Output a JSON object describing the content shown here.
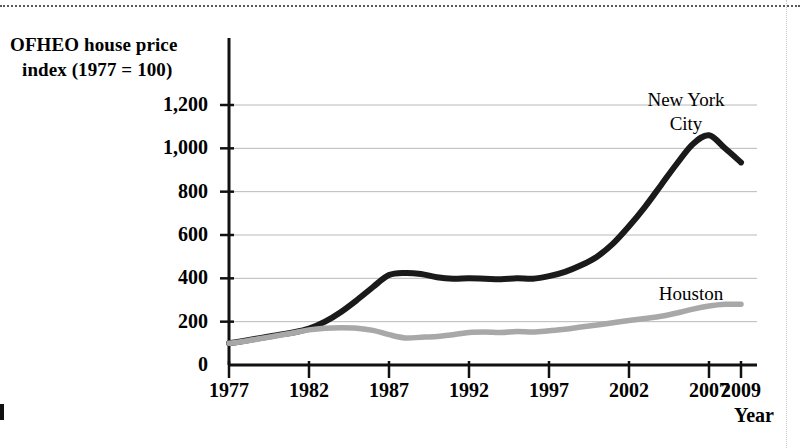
{
  "chart_data": {
    "type": "line",
    "title": "",
    "ylabel": "OFHEO house price index (1977 = 100)",
    "ylabel_line1": "OFHEO house price",
    "ylabel_line2": "index (1977 = 100)",
    "xlabel": "Year",
    "ylim": [
      0,
      1200
    ],
    "xlim": [
      1977,
      2009
    ],
    "grid": true,
    "gridlines_y": [
      200,
      400,
      600,
      800,
      1000,
      1200
    ],
    "ytick_labels": [
      "0",
      "200",
      "400",
      "600",
      "800",
      "1,000",
      "1,200"
    ],
    "ytick_values": [
      0,
      200,
      400,
      600,
      800,
      1000,
      1200
    ],
    "xtick_labels": [
      "1977",
      "1982",
      "1987",
      "1992",
      "1997",
      "2002",
      "2007",
      "2009"
    ],
    "xtick_values": [
      1977,
      1982,
      1987,
      1992,
      1997,
      2002,
      2007,
      2009
    ],
    "legend_position": "inline-labels",
    "x": [
      1977,
      1978,
      1979,
      1980,
      1981,
      1982,
      1983,
      1984,
      1985,
      1986,
      1987,
      1988,
      1989,
      1990,
      1991,
      1992,
      1993,
      1994,
      1995,
      1996,
      1997,
      1998,
      1999,
      2000,
      2001,
      2002,
      2003,
      2004,
      2005,
      2006,
      2007,
      2008,
      2009
    ],
    "series": [
      {
        "name": "New York City",
        "label_line1": "New York",
        "label_line2": "City",
        "color": "#1a1a1a",
        "values": [
          100,
          112,
          125,
          138,
          150,
          168,
          200,
          245,
          300,
          360,
          415,
          425,
          420,
          405,
          398,
          400,
          398,
          396,
          400,
          398,
          410,
          430,
          460,
          500,
          560,
          640,
          730,
          830,
          930,
          1020,
          1060,
          1000,
          935
        ]
      },
      {
        "name": "Houston",
        "label_line1": "Houston",
        "label_line2": "",
        "color": "#a8a8a8",
        "values": [
          100,
          110,
          122,
          135,
          148,
          162,
          170,
          172,
          170,
          160,
          140,
          125,
          128,
          132,
          140,
          150,
          152,
          150,
          155,
          152,
          158,
          165,
          175,
          185,
          195,
          205,
          215,
          225,
          240,
          258,
          272,
          280,
          280
        ]
      }
    ]
  }
}
